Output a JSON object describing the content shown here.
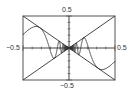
{
  "chart_data": {
    "type": "line",
    "title": "",
    "xlabel": "",
    "ylabel": "",
    "xlim": [
      -0.5,
      0.5
    ],
    "ylim": [
      -0.5,
      0.5
    ],
    "grid": false,
    "legend": null,
    "tick_labels": {
      "x_left": "−0.5",
      "x_right": "0.5",
      "y_top": "0.5",
      "y_bottom": "−0.5"
    },
    "series": [
      {
        "name": "x cos(1/x)",
        "expr": "x*cos(1/x)",
        "x": [
          -0.5,
          -0.4,
          -0.318,
          -0.25,
          -0.2,
          -0.159,
          -0.1,
          -0.05,
          0,
          0.05,
          0.1,
          0.159,
          0.2,
          0.25,
          0.318,
          0.4,
          0.5
        ],
        "values": [
          0.208,
          0.032,
          0.318,
          0.163,
          -0.057,
          -0.159,
          0.084,
          -0.02,
          0,
          0.02,
          -0.084,
          0.159,
          0.057,
          -0.163,
          -0.318,
          -0.032,
          -0.208
        ]
      },
      {
        "name": "y = x",
        "expr": "x",
        "x": [
          -0.5,
          0.5
        ],
        "values": [
          -0.5,
          0.5
        ]
      },
      {
        "name": "y = -x",
        "expr": "-x",
        "x": [
          -0.5,
          0.5
        ],
        "values": [
          0.5,
          -0.5
        ]
      }
    ],
    "frame": true,
    "axes_origin": [
      0,
      0
    ]
  },
  "colors": {
    "line": "#333333",
    "frame": "#555555",
    "axis": "#444444"
  }
}
